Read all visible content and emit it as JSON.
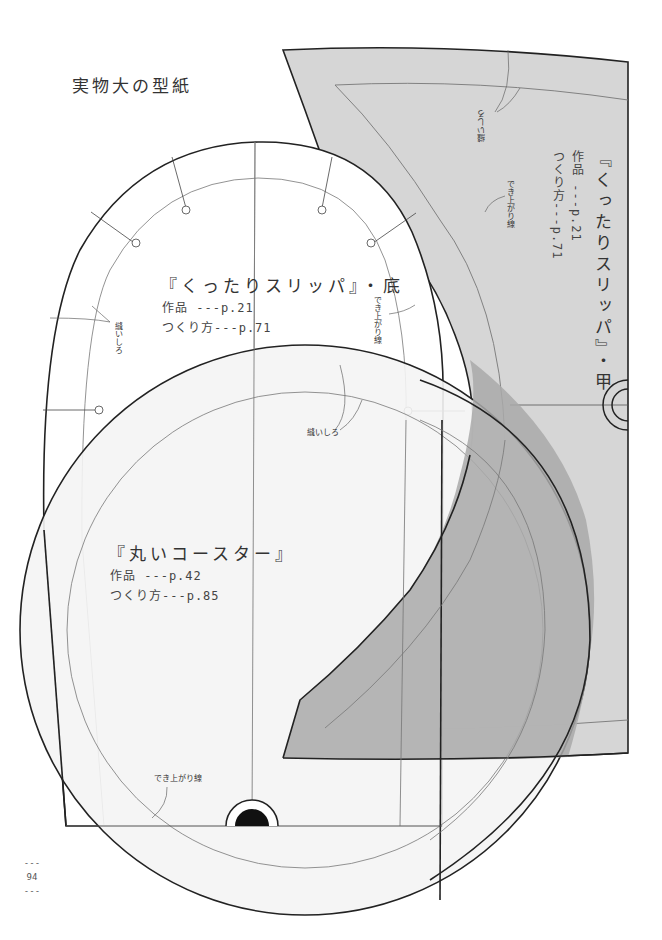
{
  "page": {
    "title": "実物大の型紙",
    "page_number": "94",
    "page_number_dash": "---"
  },
  "colors": {
    "paper": "#ffffff",
    "instep_fill": "#d6d6d6",
    "overlap_fill": "#a9a9a9",
    "coaster_fill": "#f4f4f4",
    "cut_line": "#222222",
    "finish_line": "#777777"
  },
  "patterns": {
    "slipper_sole": {
      "title": "『くったりスリッパ』・底",
      "work_ref": "作品 ---p.21",
      "howto_ref": "つくり方---p.71",
      "seam_allowance_label": "縫いしろ",
      "finish_line_label": "でき上がり線"
    },
    "slipper_instep": {
      "title": "『くったりスリッパ』・甲",
      "work_ref": "作品 ---p.21",
      "howto_ref": "つくり方---p.71",
      "seam_allowance_label": "縫いしろ",
      "finish_line_label": "でき上がり線"
    },
    "round_coaster": {
      "title": "『丸いコースター』",
      "work_ref": "作品 ---p.42",
      "howto_ref": "つくり方---p.85",
      "seam_allowance_label": "縫いしろ",
      "finish_line_label": "でき上がり線"
    }
  }
}
